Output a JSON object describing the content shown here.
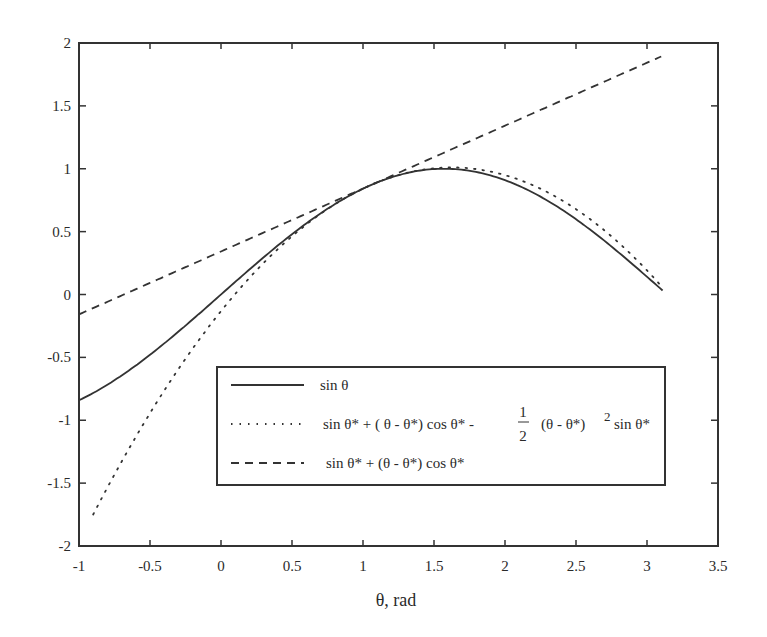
{
  "chart_data": {
    "type": "line",
    "title": "",
    "xlabel": "θ, rad",
    "ylabel": "",
    "xlim": [
      -1,
      3.5
    ],
    "ylim": [
      -2,
      2
    ],
    "grid": false,
    "legend_position": "lower right (inside plot, boxed)",
    "x_ticks": [
      -1,
      -0.5,
      0,
      0.5,
      1,
      1.5,
      2,
      2.5,
      3,
      3.5
    ],
    "x_tick_labels": [
      "-1",
      "-0.5",
      "0",
      "0.5",
      "1",
      "1.5",
      "2",
      "2.5",
      "3",
      "3.5"
    ],
    "y_ticks": [
      -2,
      -1.5,
      -1,
      -0.5,
      0,
      0.5,
      1,
      1.5,
      2
    ],
    "y_tick_labels": [
      "-2",
      "-1.5",
      "-1",
      "-0.5",
      "0",
      "0.5",
      "1",
      "1.5",
      "2"
    ],
    "theta_star": 1.047,
    "series": [
      {
        "name": "sin θ",
        "style": "solid",
        "x": [
          -1.0,
          -0.75,
          -0.5,
          -0.25,
          0.0,
          0.25,
          0.5,
          0.75,
          1.0,
          1.25,
          1.5,
          1.571,
          1.75,
          2.0,
          2.25,
          2.5,
          2.75,
          3.0,
          3.11
        ],
        "values": [
          -0.841,
          -0.682,
          -0.479,
          -0.247,
          0.0,
          0.247,
          0.479,
          0.682,
          0.841,
          0.949,
          0.997,
          1.0,
          0.984,
          0.909,
          0.778,
          0.598,
          0.382,
          0.141,
          0.032
        ]
      },
      {
        "name": "sin θ* + (θ - θ*) cos θ* - ½ (θ - θ*)² sin θ*",
        "style": "dotted",
        "x": [
          -0.9,
          -0.75,
          -0.5,
          -0.25,
          0.0,
          0.25,
          0.5,
          0.75,
          1.0,
          1.25,
          1.5,
          1.75,
          2.0,
          2.25,
          2.5,
          2.75,
          3.0,
          3.1
        ],
        "values": [
          -1.749,
          -1.5,
          -1.117,
          -0.775,
          -0.48,
          -0.23,
          -0.021,
          0.679,
          0.842,
          0.951,
          0.999,
          0.993,
          0.935,
          0.838,
          0.687,
          0.486,
          0.232,
          0.116
        ]
      },
      {
        "name": "sin θ* + (θ - θ*) cos θ*",
        "style": "dashed",
        "x": [
          -1.0,
          3.1
        ],
        "values": [
          -0.157,
          1.893
        ]
      }
    ]
  },
  "legend": {
    "items": [
      {
        "label": "sin θ",
        "style": "solid"
      },
      {
        "label": "sin θ* + ( θ - θ*) cos θ* -",
        "frac_num": "1",
        "frac_den": "2",
        "label_tail": "(θ - θ*)",
        "sup": "2",
        "label_end": "sin θ*",
        "style": "dotted"
      },
      {
        "label": "sin θ* + (θ - θ*) cos θ*",
        "style": "dashed"
      }
    ]
  },
  "colors": {
    "line": "#333333",
    "axis": "#333333",
    "background": "#ffffff"
  }
}
